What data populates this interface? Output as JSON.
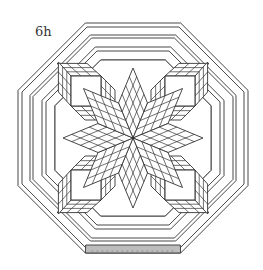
{
  "figure": {
    "label": "6h",
    "colors": {
      "line": "#333333",
      "fill": "#ffffff",
      "shaded_strip": "#bdbdbd"
    },
    "star": {
      "points": 8,
      "diamond_grid": 4
    },
    "cubes": {
      "count": 4,
      "side_grid": 3
    },
    "border_strips": 4,
    "shaded_edge": "bottom"
  }
}
